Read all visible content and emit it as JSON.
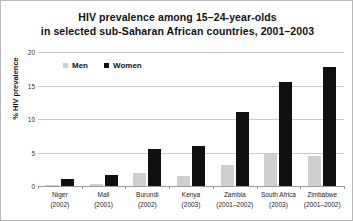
{
  "chart_data": {
    "type": "bar",
    "title": "HIV prevalence among 15–24-year-olds in selected sub-Saharan African countries, 2001–2003",
    "title_line1": "HIV prevalence among 15–24-year-olds",
    "title_line2": "in selected sub-Saharan African countries, 2001–2003",
    "xlabel": "",
    "ylabel": "% HIV prevalence",
    "ylim": [
      0,
      20
    ],
    "yticks": [
      "0",
      "5",
      "10",
      "15",
      "20"
    ],
    "ytick_values": [
      0,
      5,
      10,
      15,
      20
    ],
    "grid": true,
    "legend_position": "upper-left-inside",
    "categories": [
      "Niger",
      "Mali",
      "Burundi",
      "Kenya",
      "Zambia",
      "South Africa",
      "Zimbabwe"
    ],
    "category_years": [
      "(2002)",
      "(2001)",
      "(2002)",
      "(2003)",
      "(2001–2002)",
      "(2003)",
      "(2001–2002)"
    ],
    "series": [
      {
        "name": "Men",
        "color": "#cfcfcf",
        "values": [
          0.2,
          0.3,
          2.0,
          1.5,
          3.2,
          4.8,
          4.5
        ]
      },
      {
        "name": "Women",
        "color": "#101010",
        "values": [
          1.0,
          1.6,
          5.5,
          6.0,
          11.0,
          15.5,
          17.8
        ]
      }
    ]
  },
  "colors": {
    "men": "#cfcfcf",
    "women": "#101010",
    "grid": "#c8c8c8",
    "axis": "#9a9a9a",
    "border": "#b9b9b9",
    "background": "#ffffff",
    "text": "#111111"
  }
}
